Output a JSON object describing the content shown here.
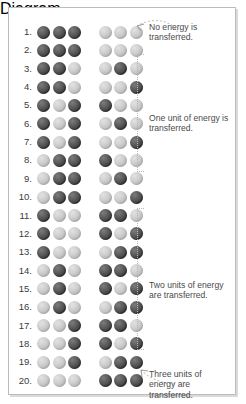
{
  "figure": {
    "ball_count_per_group": 3,
    "groups": 2,
    "dark_label": "energy unit",
    "light_label": "no energy",
    "colors": {
      "dark": "#3f3f3f",
      "light": "#bdbdbd",
      "border": "#b9bcbf",
      "text": "#4a4a4a",
      "bracket": "#b5b5b5"
    }
  },
  "rows": [
    {
      "number": "1.",
      "left": [
        "D",
        "D",
        "D"
      ],
      "right": [
        "L",
        "L",
        "L"
      ]
    },
    {
      "number": "2.",
      "left": [
        "D",
        "D",
        "D"
      ],
      "right": [
        "L",
        "L",
        "L"
      ]
    },
    {
      "number": "3.",
      "left": [
        "D",
        "D",
        "L"
      ],
      "right": [
        "L",
        "D",
        "L"
      ]
    },
    {
      "number": "4.",
      "left": [
        "D",
        "D",
        "L"
      ],
      "right": [
        "L",
        "L",
        "D"
      ]
    },
    {
      "number": "5.",
      "left": [
        "D",
        "L",
        "D"
      ],
      "right": [
        "D",
        "L",
        "L"
      ]
    },
    {
      "number": "6.",
      "left": [
        "D",
        "L",
        "D"
      ],
      "right": [
        "L",
        "D",
        "L"
      ]
    },
    {
      "number": "7.",
      "left": [
        "D",
        "L",
        "D"
      ],
      "right": [
        "L",
        "L",
        "D"
      ]
    },
    {
      "number": "8.",
      "left": [
        "L",
        "D",
        "D"
      ],
      "right": [
        "D",
        "L",
        "L"
      ]
    },
    {
      "number": "9.",
      "left": [
        "L",
        "D",
        "D"
      ],
      "right": [
        "L",
        "D",
        "L"
      ]
    },
    {
      "number": "10.",
      "left": [
        "L",
        "D",
        "D"
      ],
      "right": [
        "L",
        "L",
        "D"
      ]
    },
    {
      "number": "11.",
      "left": [
        "D",
        "L",
        "L"
      ],
      "right": [
        "D",
        "D",
        "L"
      ]
    },
    {
      "number": "12.",
      "left": [
        "D",
        "L",
        "L"
      ],
      "right": [
        "D",
        "L",
        "D"
      ]
    },
    {
      "number": "13.",
      "left": [
        "D",
        "L",
        "L"
      ],
      "right": [
        "L",
        "D",
        "D"
      ]
    },
    {
      "number": "14.",
      "left": [
        "L",
        "D",
        "L"
      ],
      "right": [
        "D",
        "D",
        "L"
      ]
    },
    {
      "number": "15.",
      "left": [
        "L",
        "D",
        "L"
      ],
      "right": [
        "D",
        "L",
        "D"
      ]
    },
    {
      "number": "16.",
      "left": [
        "L",
        "D",
        "L"
      ],
      "right": [
        "L",
        "D",
        "D"
      ]
    },
    {
      "number": "17.",
      "left": [
        "L",
        "L",
        "D"
      ],
      "right": [
        "D",
        "D",
        "L"
      ]
    },
    {
      "number": "18.",
      "left": [
        "L",
        "L",
        "D"
      ],
      "right": [
        "D",
        "L",
        "D"
      ]
    },
    {
      "number": "19.",
      "left": [
        "L",
        "L",
        "D"
      ],
      "right": [
        "L",
        "D",
        "D"
      ]
    },
    {
      "number": "20.",
      "left": [
        "L",
        "L",
        "L"
      ],
      "right": [
        "D",
        "D",
        "D"
      ]
    }
  ],
  "annotations": [
    {
      "id": "note-0",
      "text": "No energy is transferred.",
      "rows": "1–2"
    },
    {
      "id": "note-1",
      "text": "One unit of energy is transferred.",
      "rows": "3–10"
    },
    {
      "id": "note-2",
      "text": "Two units of energy are transferred.",
      "rows": "11–19"
    },
    {
      "id": "note-3",
      "text": "Three units of energy are transferred.",
      "rows": "20"
    }
  ]
}
